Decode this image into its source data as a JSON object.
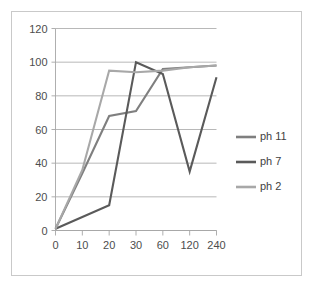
{
  "chart_data": {
    "type": "line",
    "title": "",
    "subtitle": "",
    "xlabel": "",
    "ylabel": "",
    "categories": [
      "0",
      "10",
      "20",
      "30",
      "60",
      "120",
      "240"
    ],
    "x_tick_labels": [
      "0",
      "10",
      "20",
      "30",
      "60",
      "120",
      "240"
    ],
    "y_tick_labels": [
      "0",
      "20",
      "40",
      "60",
      "80",
      "100",
      "120"
    ],
    "ylim": [
      0,
      120
    ],
    "y_tick_step": 20,
    "grid": "horizontal",
    "legend_position": "right",
    "series": [
      {
        "name": "ph 11",
        "color": "#7f7f7f",
        "values": [
          1,
          34,
          68,
          71,
          96,
          97,
          98
        ]
      },
      {
        "name": "ph 7",
        "color": "#5a5a5a",
        "values": [
          1,
          8,
          15,
          100,
          93,
          35,
          91
        ]
      },
      {
        "name": "ph 2",
        "color": "#a8a8a8",
        "values": [
          1,
          36,
          95,
          94,
          95,
          97,
          98
        ]
      }
    ]
  },
  "legend": {
    "entries": [
      {
        "label": "ph 11"
      },
      {
        "label": "ph 7"
      },
      {
        "label": "ph 2"
      }
    ]
  },
  "colors": {
    "frame_border": "#c9c9c9",
    "gridline": "#a6a6a6",
    "axis": "#a6a6a6",
    "tick_text": "#4d4d4d",
    "legend_text": "#3f3f3f",
    "background": "#ffffff"
  }
}
